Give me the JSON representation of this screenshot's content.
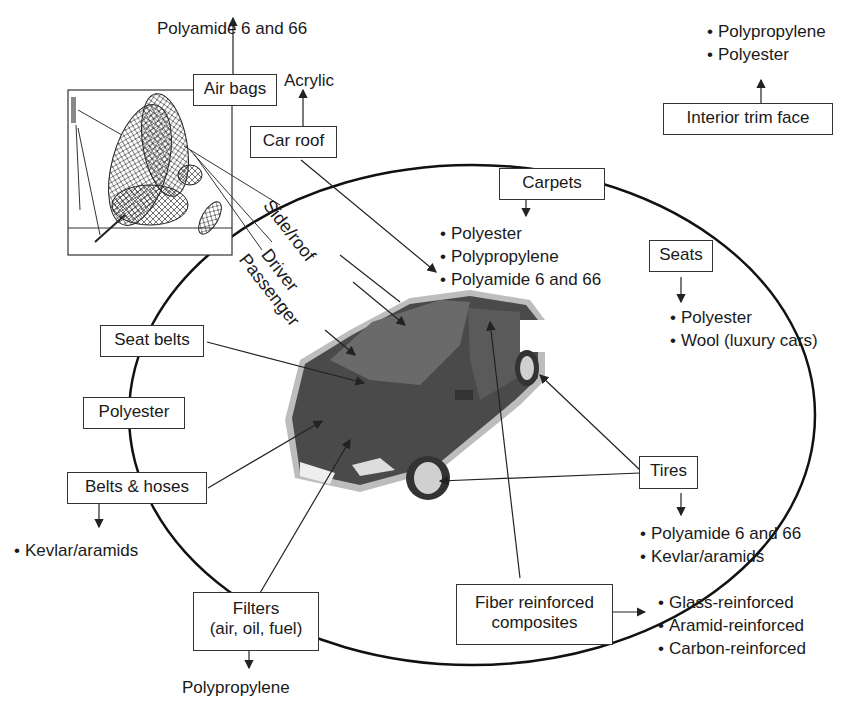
{
  "diagram": {
    "components": [
      {
        "id": "air_bags",
        "label": "Air bags",
        "materials": [
          "Polyamide 6 and 66"
        ],
        "subtypes": [
          "Side/roof",
          "Driver",
          "Passenger"
        ]
      },
      {
        "id": "car_roof",
        "label": "Car roof",
        "materials": [
          "Acrylic"
        ]
      },
      {
        "id": "interior_trim",
        "label": "Interior trim face",
        "materials": [
          "Polypropylene",
          "Polyester"
        ]
      },
      {
        "id": "carpets",
        "label": "Carpets",
        "materials": [
          "Polyester",
          "Polypropylene",
          "Polyamide 6 and 66"
        ]
      },
      {
        "id": "seats",
        "label": "Seats",
        "materials": [
          "Polyester",
          "Wool (luxury cars)"
        ]
      },
      {
        "id": "seat_belts",
        "label": "Seat belts",
        "materials": [
          "Polyester"
        ]
      },
      {
        "id": "belts_hoses",
        "label": "Belts & hoses",
        "materials": [
          "Kevlar/aramids"
        ]
      },
      {
        "id": "tires",
        "label": "Tires",
        "materials": [
          "Polyamide 6 and 66",
          "Kevlar/aramids"
        ]
      },
      {
        "id": "filters",
        "label": "Filters (air, oil, fuel)",
        "materials": [
          "Polypropylene"
        ]
      },
      {
        "id": "fiber_composites",
        "label": "Fiber reinforced composites",
        "materials": [
          "Glass-reinforced",
          "Aramid-reinforced",
          "Carbon-reinforced"
        ]
      }
    ]
  },
  "labels": {
    "air_bags": "Air bags",
    "air_bags_material": "Polyamide 6 and 66",
    "side_roof": "Side/roof",
    "driver": "Driver",
    "passenger": "Passenger",
    "car_roof": "Car roof",
    "car_roof_material": "Acrylic",
    "interior_trim": "Interior trim face",
    "interior_trim_materials": [
      "Polypropylene",
      "Polyester"
    ],
    "carpets": "Carpets",
    "carpets_materials": [
      "Polyester",
      "Polypropylene",
      "Polyamide 6 and 66"
    ],
    "seats": "Seats",
    "seats_materials": [
      "Polyester",
      "Wool (luxury cars)"
    ],
    "seat_belts": "Seat belts",
    "seat_belts_material": "Polyester",
    "belts_hoses": "Belts & hoses",
    "belts_hoses_materials": [
      "Kevlar/aramids"
    ],
    "tires": "Tires",
    "tires_materials": [
      "Polyamide 6 and 66",
      "Kevlar/aramids"
    ],
    "filters_line1": "Filters",
    "filters_line2": "(air, oil, fuel)",
    "filters_material": "Polypropylene",
    "composites_line1": "Fiber reinforced",
    "composites_line2": "composites",
    "composites_materials": [
      "Glass-reinforced",
      "Aramid-reinforced",
      "Carbon-reinforced"
    ]
  },
  "colors": {
    "line": "#222222",
    "car_body": "#4a4a4a",
    "car_glow": "#bdbdbd"
  }
}
